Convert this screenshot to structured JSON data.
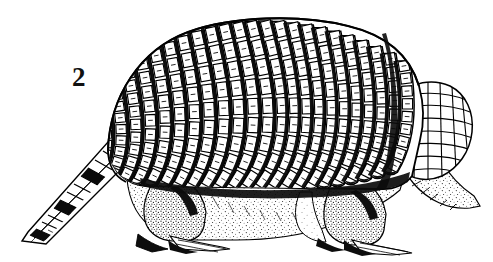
{
  "figure": {
    "number_label": "2",
    "caption": "",
    "view": "left lateral profile",
    "medium": "black-and-white pen-and-ink line engraving",
    "background_color": "#ffffff",
    "ink_color": "#000000",
    "width_px": 493,
    "height_px": 262
  },
  "anatomy": {
    "parts": [
      {
        "name": "carapace",
        "label": "dorsal carapace (banded shell)",
        "bands_visible": 23
      },
      {
        "name": "scapular-shield",
        "label": "scapular shield"
      },
      {
        "name": "pelvic-shield",
        "label": "pelvic shield"
      },
      {
        "name": "head-shield",
        "label": "head shield with polygonal scutes"
      },
      {
        "name": "ear",
        "label": "ear"
      },
      {
        "name": "eye",
        "label": "eye"
      },
      {
        "name": "snout",
        "label": "tapered snout"
      },
      {
        "name": "tail",
        "label": "ringed tapering tail"
      },
      {
        "name": "foreleg",
        "label": "foreleg with digging claws"
      },
      {
        "name": "hindleg",
        "label": "hindleg with claws"
      },
      {
        "name": "flank",
        "label": "stippled hairy flank"
      }
    ]
  },
  "geometry": {
    "carapace_top_y": 21,
    "carapace_left_x": 108,
    "snout_tip": {
      "x": 479,
      "y": 206
    },
    "tail_tip": {
      "x": 22,
      "y": 241
    },
    "tail_base": {
      "x": 122,
      "y": 132
    },
    "eye": {
      "x": 425,
      "y": 152
    },
    "ground_line_y": 250
  },
  "band_offsets": [
    -0.5,
    -0.458,
    -0.416,
    -0.374,
    -0.332,
    -0.29,
    -0.248,
    -0.206,
    -0.164,
    -0.122,
    -0.08,
    -0.038,
    0.004,
    0.046,
    0.088,
    0.13,
    0.172,
    0.214,
    0.256,
    0.298,
    0.34,
    0.382,
    0.424
  ],
  "scute_rows": 9
}
